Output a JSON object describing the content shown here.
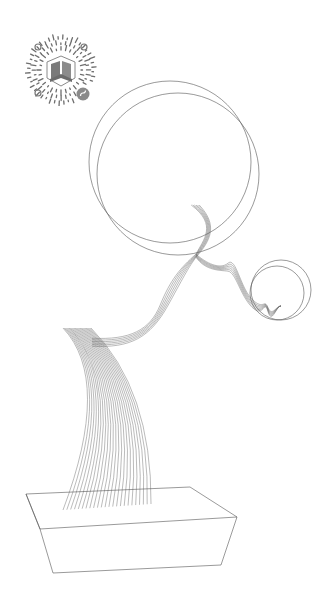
{
  "artwork": {
    "title": "Bonsai line art poster",
    "colors": {
      "background": "#ffffff",
      "line": "#555555",
      "code": "#6e6e6e"
    },
    "mini_program_code": {
      "icon": "wechat-mini-program-code",
      "logo": "building-book-logo",
      "badge": "mini-program-badge-icon",
      "center": [
        61,
        70
      ],
      "radius": 36
    },
    "elements": {
      "moon_large": {
        "circles": [
          {
            "cx": 170,
            "cy": 162,
            "r": 81
          },
          {
            "cx": 178,
            "cy": 174,
            "r": 81
          }
        ]
      },
      "moon_small": {
        "circles": [
          {
            "cx": 277,
            "cy": 293,
            "r": 27
          },
          {
            "cx": 281,
            "cy": 290,
            "r": 30
          }
        ]
      },
      "trunk": {
        "strands": 24
      },
      "branch_strands": 6,
      "pot": {
        "shape": "rectangular-box"
      }
    }
  }
}
